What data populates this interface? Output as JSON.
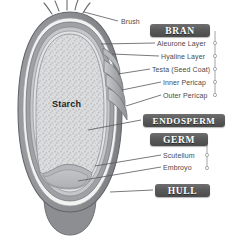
{
  "diagram": {
    "center_caption": "Starch",
    "banners": [
      {
        "id": "bran",
        "label": "BRAN"
      },
      {
        "id": "endosperm",
        "label": "ENDOSPERM"
      },
      {
        "id": "germ",
        "label": "GERM"
      },
      {
        "id": "hull",
        "label": "HULL"
      }
    ],
    "labels": [
      {
        "id": "brush",
        "label": "Brush"
      },
      {
        "id": "aleurone",
        "label": "Aleurone Layer"
      },
      {
        "id": "hyaline",
        "label": "Hyaline Layer"
      },
      {
        "id": "testa",
        "label": "Testa (Seed Coat)"
      },
      {
        "id": "inner-pericap",
        "label": "Inner Pericap"
      },
      {
        "id": "outer-pericap",
        "label": "Outer Pericap"
      },
      {
        "id": "scutellum",
        "label": "Scutellum"
      },
      {
        "id": "embryo",
        "label": "Embroyo"
      }
    ],
    "colors": {
      "banner_dark": "#5a5a5a",
      "banner_text": "#ffffff",
      "hull_outer": "#8f9195",
      "hull_inner": "#a8aaae",
      "bran_layer": "#9a9ca0",
      "endosperm_fill": "#d8d9da",
      "germ_fill": "#b9bbbe",
      "leader_line": "#58585a",
      "outline": "#6e7073",
      "label_text": "#4a4a4a",
      "caption_text": "#1f1f1f",
      "background": "#ffffff"
    }
  }
}
